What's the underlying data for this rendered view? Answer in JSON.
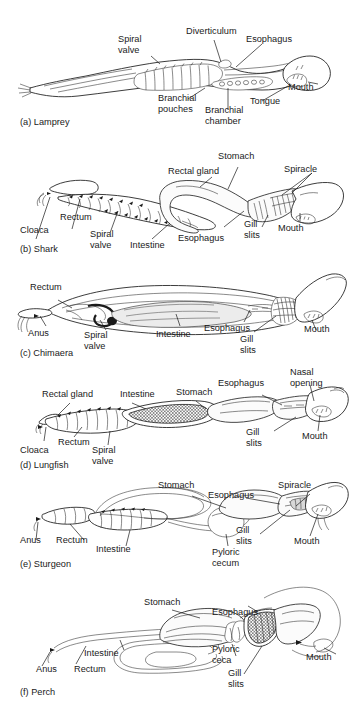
{
  "figure": {
    "background": "#ffffff",
    "ink": "#1a1a1a",
    "width": 353,
    "height": 707
  },
  "panels": [
    {
      "id": "a",
      "caption": "(a) Lamprey",
      "animal": "Lamprey",
      "labels": [
        {
          "name": "spiral-valve",
          "text_line1": "Spiral",
          "text_line2": "valve"
        },
        {
          "name": "diverticulum",
          "text_line1": "Diverticulum",
          "text_line2": ""
        },
        {
          "name": "esophagus",
          "text_line1": "Esophagus",
          "text_line2": ""
        },
        {
          "name": "mouth",
          "text_line1": "Mouth",
          "text_line2": ""
        },
        {
          "name": "tongue",
          "text_line1": "Tongue",
          "text_line2": ""
        },
        {
          "name": "branchial-chamber",
          "text_line1": "Branchial",
          "text_line2": "chamber"
        },
        {
          "name": "branchial-pouches",
          "text_line1": "Branchial",
          "text_line2": "pouches"
        }
      ]
    },
    {
      "id": "b",
      "caption": "(b) Shark",
      "animal": "Shark",
      "labels": [
        {
          "name": "stomach",
          "text_line1": "Stomach",
          "text_line2": ""
        },
        {
          "name": "rectal-gland",
          "text_line1": "Rectal gland",
          "text_line2": ""
        },
        {
          "name": "spiracle",
          "text_line1": "Spiracle",
          "text_line2": ""
        },
        {
          "name": "mouth",
          "text_line1": "Mouth",
          "text_line2": ""
        },
        {
          "name": "gill-slits",
          "text_line1": "Gill",
          "text_line2": "slits"
        },
        {
          "name": "esophagus",
          "text_line1": "Esophagus",
          "text_line2": ""
        },
        {
          "name": "intestine",
          "text_line1": "Intestine",
          "text_line2": ""
        },
        {
          "name": "spiral-valve",
          "text_line1": "Spiral",
          "text_line2": "valve"
        },
        {
          "name": "rectum",
          "text_line1": "Rectum",
          "text_line2": ""
        },
        {
          "name": "cloaca",
          "text_line1": "Cloaca",
          "text_line2": ""
        }
      ]
    },
    {
      "id": "c",
      "caption": "(c) Chimaera",
      "animal": "Chimaera",
      "labels": [
        {
          "name": "rectum",
          "text_line1": "Rectum",
          "text_line2": ""
        },
        {
          "name": "anus",
          "text_line1": "Anus",
          "text_line2": ""
        },
        {
          "name": "spiral-valve",
          "text_line1": "Spiral",
          "text_line2": "valve"
        },
        {
          "name": "intestine",
          "text_line1": "Intestine",
          "text_line2": ""
        },
        {
          "name": "esophagus",
          "text_line1": "Esophagus",
          "text_line2": ""
        },
        {
          "name": "gill-slits",
          "text_line1": "Gill",
          "text_line2": "slits"
        },
        {
          "name": "mouth",
          "text_line1": "Mouth",
          "text_line2": ""
        }
      ]
    },
    {
      "id": "d",
      "caption": "(d) Lungfish",
      "animal": "Lungfish",
      "labels": [
        {
          "name": "rectal-gland",
          "text_line1": "Rectal gland",
          "text_line2": ""
        },
        {
          "name": "intestine",
          "text_line1": "Intestine",
          "text_line2": ""
        },
        {
          "name": "stomach",
          "text_line1": "Stomach",
          "text_line2": ""
        },
        {
          "name": "esophagus",
          "text_line1": "Esophagus",
          "text_line2": ""
        },
        {
          "name": "nasal-opening",
          "text_line1": "Nasal",
          "text_line2": "opening"
        },
        {
          "name": "mouth",
          "text_line1": "Mouth",
          "text_line2": ""
        },
        {
          "name": "gill-slits",
          "text_line1": "Gill",
          "text_line2": "slits"
        },
        {
          "name": "spiral-valve",
          "text_line1": "Spiral",
          "text_line2": "valve"
        },
        {
          "name": "rectum",
          "text_line1": "Rectum",
          "text_line2": ""
        },
        {
          "name": "cloaca",
          "text_line1": "Cloaca",
          "text_line2": ""
        }
      ]
    },
    {
      "id": "e",
      "caption": "(e) Sturgeon",
      "animal": "Sturgeon",
      "labels": [
        {
          "name": "stomach",
          "text_line1": "Stomach",
          "text_line2": ""
        },
        {
          "name": "esophagus",
          "text_line1": "Esophagus",
          "text_line2": ""
        },
        {
          "name": "spiracle",
          "text_line1": "Spiracle",
          "text_line2": ""
        },
        {
          "name": "mouth",
          "text_line1": "Mouth",
          "text_line2": ""
        },
        {
          "name": "gill-slits",
          "text_line1": "Gill",
          "text_line2": "slits"
        },
        {
          "name": "pyloric-cecum",
          "text_line1": "Pyloric",
          "text_line2": "cecum"
        },
        {
          "name": "intestine",
          "text_line1": "Intestine",
          "text_line2": ""
        },
        {
          "name": "rectum",
          "text_line1": "Rectum",
          "text_line2": ""
        },
        {
          "name": "anus",
          "text_line1": "Anus",
          "text_line2": ""
        }
      ]
    },
    {
      "id": "f",
      "caption": "(f) Perch",
      "animal": "Perch",
      "labels": [
        {
          "name": "stomach",
          "text_line1": "Stomach",
          "text_line2": ""
        },
        {
          "name": "esophagus",
          "text_line1": "Esophagus",
          "text_line2": ""
        },
        {
          "name": "mouth",
          "text_line1": "Mouth",
          "text_line2": ""
        },
        {
          "name": "pyloric-ceca",
          "text_line1": "Pyloric",
          "text_line2": "ceca"
        },
        {
          "name": "gill-slits",
          "text_line1": "Gill",
          "text_line2": "slits"
        },
        {
          "name": "intestine",
          "text_line1": "Intestine",
          "text_line2": ""
        },
        {
          "name": "rectum",
          "text_line1": "Rectum",
          "text_line2": ""
        },
        {
          "name": "anus",
          "text_line1": "Anus",
          "text_line2": ""
        }
      ]
    }
  ]
}
